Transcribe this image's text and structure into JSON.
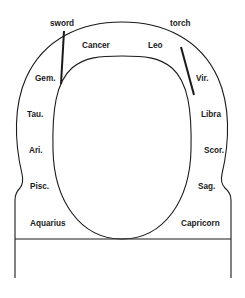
{
  "diagram": {
    "type": "zodiac-shrine-layout",
    "top_labels": {
      "left": "sword",
      "right": "torch"
    },
    "signs": {
      "cancer": "Cancer",
      "leo": "Leo",
      "gemini": "Gem.",
      "virgo": "Vir.",
      "taurus": "Tau.",
      "libra": "Libra",
      "aries": "Ari.",
      "scorpio": "Scor.",
      "pisces": "Pisc.",
      "sagittarius": "Sag.",
      "aquarius": "Aquarius",
      "capricorn": "Capricorn"
    },
    "line_color": "#1a1a1a",
    "background": "#ffffff"
  }
}
